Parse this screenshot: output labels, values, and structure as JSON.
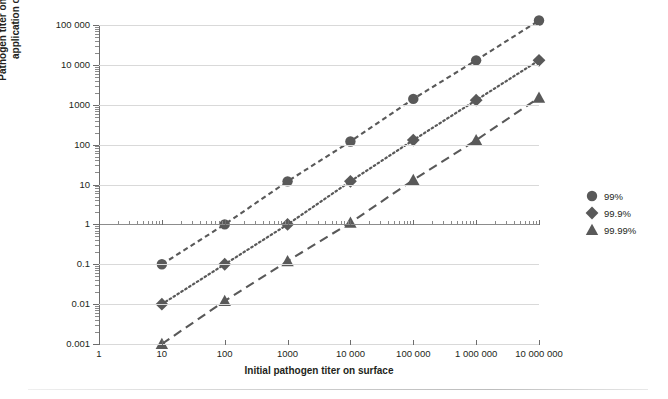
{
  "chart_data": {
    "type": "line",
    "title": "",
    "xlabel": "Initial pathogen titer on surface",
    "ylabel": "Pathogen titer on surface following application of microbicide",
    "xscale": "log",
    "yscale": "log",
    "xlim": [
      1,
      10000000
    ],
    "ylim": [
      0.001,
      100000
    ],
    "grid": true,
    "legend_position": "right",
    "x_tick_labels": [
      "1",
      "10",
      "100",
      "1000",
      "10 000",
      "100 000",
      "1 000 000",
      "10 000 000"
    ],
    "x_tick_values": [
      1,
      10,
      100,
      1000,
      10000,
      100000,
      1000000,
      10000000
    ],
    "y_tick_labels": [
      "0.001",
      "0.01",
      "0.1",
      "1",
      "10",
      "100",
      "1000",
      "10 000",
      "100 000"
    ],
    "y_tick_values": [
      0.001,
      0.01,
      0.1,
      1,
      10,
      100,
      1000,
      10000,
      100000
    ],
    "x": [
      10,
      100,
      1000,
      10000,
      100000,
      1000000,
      10000000
    ],
    "series": [
      {
        "name": "99%",
        "marker": "circle",
        "linestyle": "dashed",
        "color": "#595959",
        "values": [
          0.1,
          1,
          12,
          120,
          1400,
          13000,
          130000
        ]
      },
      {
        "name": "99.9%",
        "marker": "diamond",
        "linestyle": "dotted",
        "color": "#595959",
        "values": [
          0.01,
          0.1,
          1,
          12,
          130,
          1300,
          13000
        ]
      },
      {
        "name": "99.99%",
        "marker": "triangle",
        "linestyle": "long-dashed",
        "color": "#595959",
        "values": [
          0.001,
          0.012,
          0.12,
          1.1,
          13,
          130,
          1500
        ]
      }
    ],
    "colors": {
      "marker": "#595959",
      "grid": "#d9d9d9",
      "axis": "#6d6d6d",
      "text": "#231f20"
    }
  }
}
